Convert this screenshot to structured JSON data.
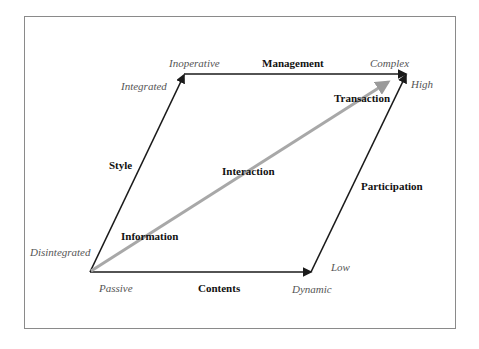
{
  "diagram": {
    "edges": {
      "top": "Management",
      "bottom": "Contents",
      "left": "Style",
      "right": "Participation"
    },
    "corner_labels": {
      "top_left_top": "Inoperative",
      "top_left_side": "Integrated",
      "top_right_top": "Complex",
      "top_right_side": "High",
      "bottom_left_side": "Disintegrated",
      "bottom_left_bottom": "Passive",
      "bottom_right_bottom": "Dynamic",
      "bottom_right_side": "Low"
    },
    "diagonal_stages": [
      "Information",
      "Interaction",
      "Transaction"
    ],
    "colors": {
      "edge": "#1a1a1a",
      "diagonal": "#a8a8a8",
      "frame": "#8a8a8a",
      "italic_text": "#555555"
    }
  }
}
